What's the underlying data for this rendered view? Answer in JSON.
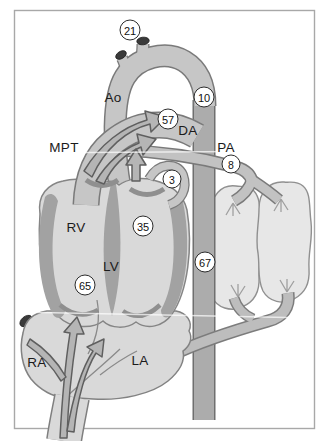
{
  "figure": {
    "labels": {
      "ao": {
        "text": "Ao"
      },
      "mpt": {
        "text": "MPT"
      },
      "da": {
        "text": "DA"
      },
      "pa": {
        "text": "PA"
      },
      "rv": {
        "text": "RV"
      },
      "lv": {
        "text": "LV"
      },
      "ra": {
        "text": "RA"
      },
      "la": {
        "text": "LA"
      }
    },
    "badges": {
      "b21": {
        "value": "21"
      },
      "b10": {
        "value": "10"
      },
      "b57": {
        "value": "57"
      },
      "b8": {
        "value": "8"
      },
      "b3": {
        "value": "3"
      },
      "b35": {
        "value": "35"
      },
      "b67": {
        "value": "67"
      },
      "b65": {
        "value": "65"
      }
    },
    "colors": {
      "vessel_fill": "#c6c6c6",
      "vessel_outline": "#7a7a7a",
      "descending_aorta_fill": "#acacac",
      "chamber_fill": "#d9d9d9",
      "heart_wall": "#a2a2a2",
      "lung_fill": "#e7e7e7",
      "arrow_fill": "#b5b5b5",
      "arrow_outline": "#5f5f5f",
      "cut_vessel_tip": "#3a3a3a",
      "badge_border": "#2c2c2c",
      "frame_border": "#a8a8a8"
    }
  }
}
